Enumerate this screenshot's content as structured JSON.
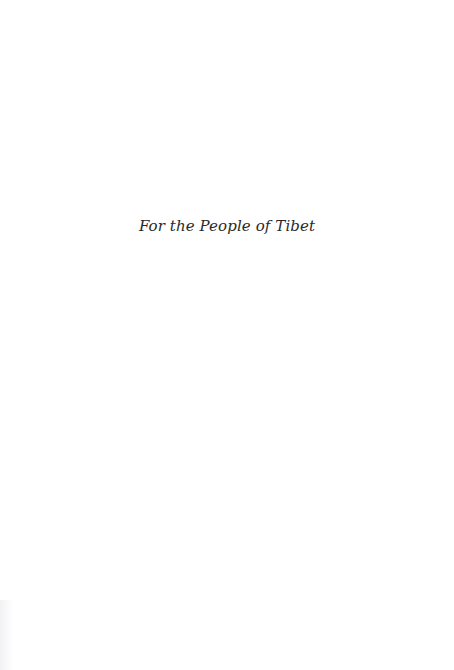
{
  "page": {
    "dedication": "For the People of Tibet",
    "colors": {
      "background": "#ffffff",
      "text": "#2a2a2a"
    }
  }
}
